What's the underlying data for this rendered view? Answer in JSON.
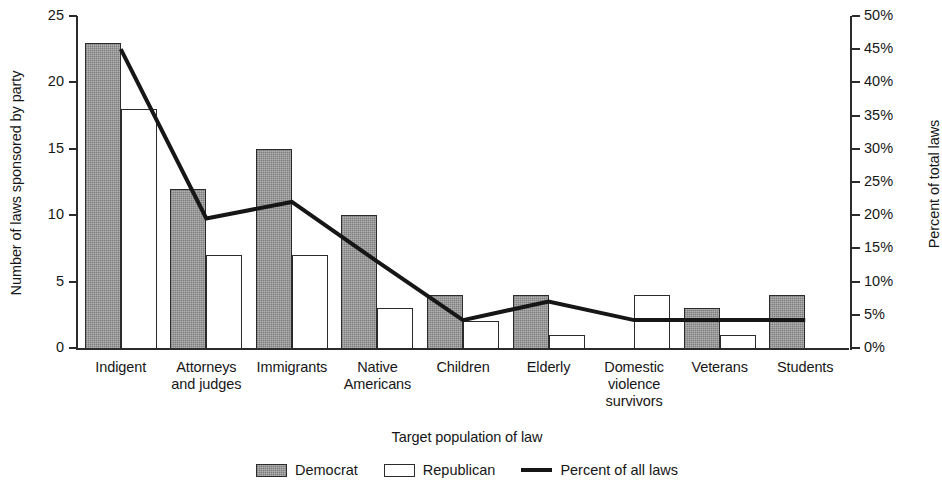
{
  "chart_data": {
    "type": "bar",
    "title": "",
    "subtitle": "",
    "xlabel": "Target population of law",
    "ylabel": "Number of laws sponsored by party",
    "ylabel_right": "Percent of total laws",
    "categories": [
      "Indigent",
      "Attorneys and judges",
      "Immigrants",
      "Native Americans",
      "Children",
      "Elderly",
      "Domestic violence survivors",
      "Veterans",
      "Students"
    ],
    "category_lines": [
      [
        "Indigent"
      ],
      [
        "Attorneys",
        "and judges"
      ],
      [
        "Immigrants"
      ],
      [
        "Native",
        "Americans"
      ],
      [
        "Children"
      ],
      [
        "Elderly"
      ],
      [
        "Domestic",
        "violence",
        "survivors"
      ],
      [
        "Veterans"
      ],
      [
        "Students"
      ]
    ],
    "series": [
      {
        "name": "Democrat",
        "kind": "bar",
        "axis": "left",
        "color": "#8d8d8d",
        "values": [
          23,
          12,
          15,
          10,
          4,
          4,
          0,
          3,
          4
        ]
      },
      {
        "name": "Republican",
        "kind": "bar",
        "axis": "left",
        "color": "#ffffff",
        "values": [
          18,
          7,
          7,
          3,
          2,
          1,
          4,
          1,
          0
        ]
      },
      {
        "name": "Percent of all laws",
        "kind": "line",
        "axis": "right",
        "color": "#161616",
        "values": [
          45,
          19.5,
          22,
          13,
          4.2,
          7,
          4.2,
          4.2,
          4.2
        ]
      }
    ],
    "ylim": [
      0,
      25
    ],
    "yticks": [
      0,
      5,
      10,
      15,
      20,
      25
    ],
    "ytick_labels": [
      "0",
      "5",
      "10",
      "15",
      "20",
      "25"
    ],
    "ylim_right": [
      0,
      50
    ],
    "yticks_right": [
      0,
      5,
      10,
      15,
      20,
      25,
      30,
      35,
      40,
      45,
      50
    ],
    "ytick_labels_right": [
      "0%",
      "5%",
      "10%",
      "15%",
      "20%",
      "25%",
      "30%",
      "35%",
      "40%",
      "45%",
      "50%"
    ],
    "grid": false,
    "legend_position": "bottom"
  },
  "legend": {
    "items": [
      {
        "label": "Democrat",
        "marker": "filled-gray-square"
      },
      {
        "label": "Republican",
        "marker": "open-white-square"
      },
      {
        "label": "Percent of all laws",
        "marker": "solid-line"
      }
    ]
  }
}
